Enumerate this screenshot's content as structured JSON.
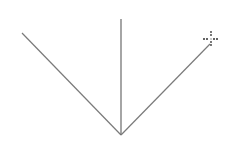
{
  "canvas": {
    "width": 236,
    "height": 147,
    "background": "#ffffff"
  },
  "lines": [
    {
      "name": "left-diagonal-line",
      "x1": 22,
      "y1": 33,
      "x2": 121,
      "y2": 135,
      "color": "#7a7a7a"
    },
    {
      "name": "vertical-line",
      "x1": 121,
      "y1": 19,
      "x2": 121,
      "y2": 135,
      "color": "#6a6a6a"
    },
    {
      "name": "right-diagonal-line",
      "x1": 121,
      "y1": 135,
      "x2": 210,
      "y2": 44,
      "color": "#7a7a7a"
    }
  ],
  "cursor": {
    "type": "crosshair-icon",
    "x": 211,
    "y": 39,
    "color": "#333333"
  }
}
